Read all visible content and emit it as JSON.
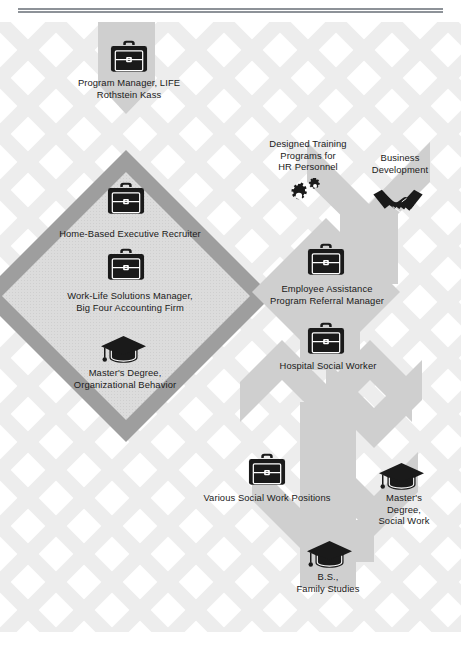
{
  "page": {
    "background_color": "#ffffff",
    "rule_color": "#8d9298",
    "lattice_color": "#ededed",
    "path_stroke_color": "#b0b0b0",
    "path_fill_color": "#d7d7d7",
    "diamond_outline_color": "#9b9b9b",
    "diamond_fill_color": "#d9d9d9",
    "icon_color": "#1a1a1a",
    "label_color": "#1a1a1a"
  },
  "nodes": [
    {
      "id": "program-manager-life",
      "icon": "briefcase-icon",
      "label": "Program Manager, LIFE\nRothstein Kass",
      "icon_x": 110,
      "icon_y": 40,
      "icon_w": 38,
      "icon_h": 33,
      "label_x": 54,
      "label_y": 77,
      "label_w": 150
    },
    {
      "id": "home-based-executive-recruiter",
      "icon": "briefcase-icon",
      "label": "Home-Based Executive Recruiter",
      "icon_x": 107,
      "icon_y": 182,
      "icon_w": 38,
      "icon_h": 33,
      "label_x": 50,
      "label_y": 228,
      "label_w": 160
    },
    {
      "id": "work-life-solutions-manager",
      "icon": "briefcase-icon",
      "label": "Work-Life Solutions Manager,\nBig Four Accounting Firm",
      "icon_x": 107,
      "icon_y": 248,
      "icon_w": 38,
      "icon_h": 33,
      "label_x": 48,
      "label_y": 290,
      "label_w": 164
    },
    {
      "id": "masters-organizational-behavior",
      "icon": "graduation-cap-icon",
      "label": "Master's Degree,\nOrganizational Behavior",
      "icon_x": 100,
      "icon_y": 335,
      "icon_w": 47,
      "icon_h": 30,
      "label_x": 46,
      "label_y": 367,
      "label_w": 158
    },
    {
      "id": "designed-training-programs",
      "icon": "gears-icon",
      "label": "Designed Training\nPrograms for\nHR Personnel",
      "icon_x": 290,
      "icon_y": 178,
      "icon_w": 36,
      "icon_h": 30,
      "label_x": 252,
      "label_y": 138,
      "label_w": 112
    },
    {
      "id": "business-development",
      "icon": "handshake-icon",
      "label": "Business\nDevelopment",
      "icon_x": 372,
      "icon_y": 186,
      "icon_w": 52,
      "icon_h": 36,
      "label_x": 356,
      "label_y": 152,
      "label_w": 88
    },
    {
      "id": "employee-assistance-program",
      "icon": "briefcase-icon",
      "label": "Employee Assistance\nProgram Referral Manager",
      "icon_x": 307,
      "icon_y": 243,
      "icon_w": 38,
      "icon_h": 33,
      "label_x": 254,
      "label_y": 283,
      "label_w": 146
    },
    {
      "id": "hospital-social-worker",
      "icon": "briefcase-icon",
      "label": "Hospital Social Worker",
      "icon_x": 307,
      "icon_y": 322,
      "icon_w": 38,
      "icon_h": 33,
      "label_x": 268,
      "label_y": 360,
      "label_w": 120
    },
    {
      "id": "various-social-work-positions",
      "icon": "briefcase-icon",
      "label": "Various Social Work Positions",
      "icon_x": 248,
      "icon_y": 453,
      "icon_w": 38,
      "icon_h": 33,
      "label_x": 194,
      "label_y": 492,
      "label_w": 146
    },
    {
      "id": "masters-social-work",
      "icon": "graduation-cap-icon",
      "label": "Master's\nDegree,\nSocial Work",
      "icon_x": 378,
      "icon_y": 462,
      "icon_w": 47,
      "icon_h": 30,
      "label_x": 367,
      "label_y": 492,
      "label_w": 74
    },
    {
      "id": "bs-family-studies",
      "icon": "graduation-cap-icon",
      "label": "B.S.,\nFamily Studies",
      "icon_x": 306,
      "icon_y": 540,
      "icon_w": 47,
      "icon_h": 30,
      "label_x": 268,
      "label_y": 571,
      "label_w": 120
    }
  ]
}
